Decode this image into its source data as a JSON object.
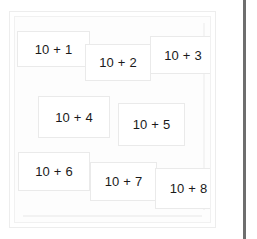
{
  "panel": {
    "name": "card-board",
    "background_color": "#fdfdfd",
    "frame_color": "#ededed"
  },
  "divider": {
    "color": "#6e6e6e",
    "orientation": "vertical"
  },
  "cards": [
    {
      "label": "10 + 1",
      "x": 17,
      "y": 31,
      "w": 73,
      "h": 36,
      "z": 1
    },
    {
      "label": "10 + 2",
      "x": 85,
      "y": 44,
      "w": 66,
      "h": 37,
      "z": 2
    },
    {
      "label": "10 + 3",
      "x": 150,
      "y": 36,
      "w": 66,
      "h": 38,
      "z": 3
    },
    {
      "label": "10 + 4",
      "x": 38,
      "y": 96,
      "w": 72,
      "h": 42,
      "z": 4
    },
    {
      "label": "10 + 5",
      "x": 118,
      "y": 103,
      "w": 67,
      "h": 43,
      "z": 5
    },
    {
      "label": "10 + 6",
      "x": 18,
      "y": 152,
      "w": 72,
      "h": 39,
      "z": 6
    },
    {
      "label": "10 + 7",
      "x": 90,
      "y": 162,
      "w": 67,
      "h": 39,
      "z": 7
    },
    {
      "label": "10 + 8",
      "x": 155,
      "y": 168,
      "w": 67,
      "h": 41,
      "z": 8
    }
  ]
}
